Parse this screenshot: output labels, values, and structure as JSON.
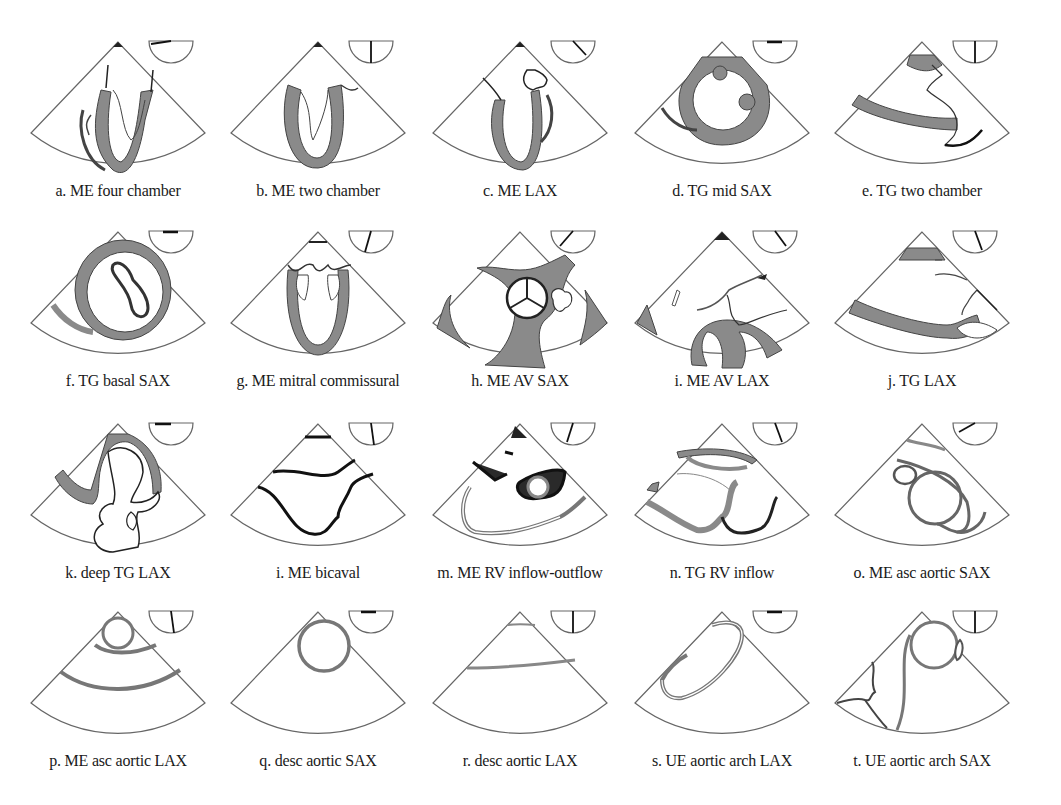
{
  "figure": {
    "colors": {
      "outline": "#555555",
      "tissue_fill": "#8a8a8a",
      "dark_fill": "#2a2a2a",
      "background": "#ffffff",
      "label": "#1a1a1a"
    },
    "panels": [
      {
        "id": "a",
        "label": "a. ME four chamber",
        "omniplane_angle_deg": 0
      },
      {
        "id": "b",
        "label": "b. ME two chamber",
        "omniplane_angle_deg": 90
      },
      {
        "id": "c",
        "label": "c. ME LAX",
        "omniplane_angle_deg": 135
      },
      {
        "id": "d",
        "label": "d. TG mid SAX",
        "omniplane_angle_deg": 0
      },
      {
        "id": "e",
        "label": "e. TG two chamber",
        "omniplane_angle_deg": 90
      },
      {
        "id": "f",
        "label": "f. TG basal SAX",
        "omniplane_angle_deg": 0
      },
      {
        "id": "g",
        "label": "g. ME mitral commissural",
        "omniplane_angle_deg": 60
      },
      {
        "id": "h",
        "label": "h. ME AV SAX",
        "omniplane_angle_deg": 45
      },
      {
        "id": "i",
        "label": "i. ME AV LAX",
        "omniplane_angle_deg": 135
      },
      {
        "id": "j",
        "label": "j. TG LAX",
        "omniplane_angle_deg": 120
      },
      {
        "id": "k",
        "label": "k. deep TG LAX",
        "omniplane_angle_deg": 0
      },
      {
        "id": "l",
        "label": "i. ME bicaval",
        "omniplane_angle_deg": 100
      },
      {
        "id": "m",
        "label": "m. ME RV inflow-outflow",
        "omniplane_angle_deg": 70
      },
      {
        "id": "n",
        "label": "n. TG RV inflow",
        "omniplane_angle_deg": 120
      },
      {
        "id": "o",
        "label": "o. ME asc aortic SAX",
        "omniplane_angle_deg": 30
      },
      {
        "id": "p",
        "label": "p. ME asc aortic LAX",
        "omniplane_angle_deg": 100
      },
      {
        "id": "q",
        "label": "q. desc aortic SAX",
        "omniplane_angle_deg": 0
      },
      {
        "id": "r",
        "label": "r. desc aortic LAX",
        "omniplane_angle_deg": 90
      },
      {
        "id": "s",
        "label": "s. UE aortic arch LAX",
        "omniplane_angle_deg": 0
      },
      {
        "id": "t",
        "label": "t. UE aortic arch SAX",
        "omniplane_angle_deg": 90
      }
    ]
  }
}
